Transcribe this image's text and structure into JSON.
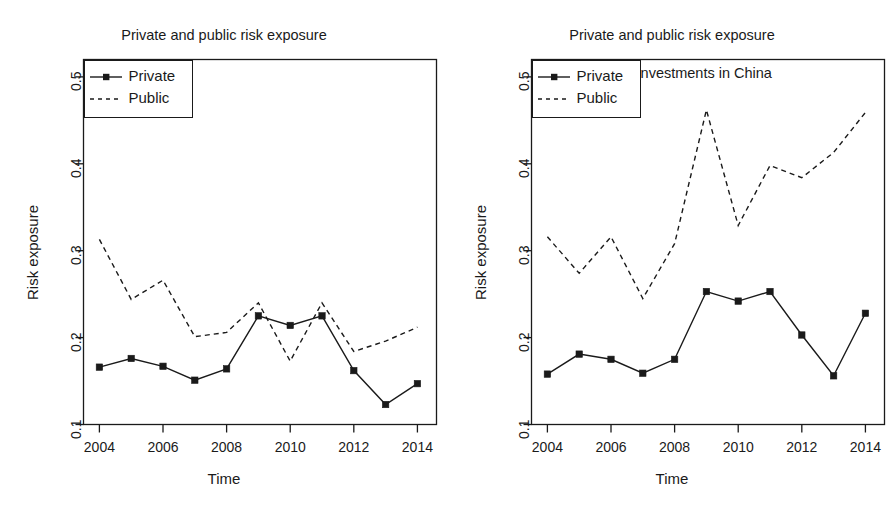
{
  "figure": {
    "width": 896,
    "height": 514,
    "background": "#ffffff",
    "ink_color": "#1a1a1a"
  },
  "panels": [
    {
      "id": "left",
      "title": "Private and public risk exposure",
      "title_lines": [
        "Private and public risk exposure"
      ],
      "xlabel": "Time",
      "ylabel": "Risk exposure",
      "legend": {
        "position": "top-left",
        "entries": [
          {
            "label": "Private",
            "style": "solid-with-square-marker"
          },
          {
            "label": "Public",
            "style": "dashed"
          }
        ]
      }
    },
    {
      "id": "right",
      "title": "Private and public risk exposure excluding investments in China",
      "title_lines": [
        "Private and public risk exposure",
        "excluding investments in China"
      ],
      "xlabel": "Time",
      "ylabel": "Risk exposure",
      "legend": {
        "position": "top-left",
        "entries": [
          {
            "label": "Private",
            "style": "solid-with-square-marker"
          },
          {
            "label": "Public",
            "style": "dashed"
          }
        ]
      }
    }
  ],
  "chart_data": [
    {
      "type": "line",
      "title": "Private and public risk exposure",
      "xlabel": "Time",
      "ylabel": "Risk exposure",
      "x": [
        2004,
        2005,
        2006,
        2007,
        2008,
        2009,
        2010,
        2011,
        2012,
        2013,
        2014
      ],
      "xticks": [
        2004,
        2006,
        2008,
        2010,
        2012,
        2014
      ],
      "xticklabels": [
        "2004",
        "2006",
        "2008",
        "2010",
        "2012",
        "2014"
      ],
      "yticks": [
        0.1,
        0.2,
        0.3,
        0.4,
        0.5
      ],
      "yticklabels": [
        "0.1",
        "0.2",
        "0.3",
        "0.4",
        "0.5"
      ],
      "xlim": [
        2003.5,
        2014.6
      ],
      "ylim": [
        0.1,
        0.52
      ],
      "grid": false,
      "legend_position": "top-left",
      "series": [
        {
          "name": "Private",
          "linestyle": "solid",
          "marker": "square",
          "values": [
            0.166,
            0.176,
            0.167,
            0.151,
            0.164,
            0.225,
            0.214,
            0.225,
            0.162,
            0.123,
            0.147
          ]
        },
        {
          "name": "Public",
          "linestyle": "dashed",
          "marker": "none",
          "values": [
            0.313,
            0.244,
            0.266,
            0.201,
            0.206,
            0.24,
            0.173,
            0.24,
            0.184,
            0.196,
            0.212
          ]
        }
      ]
    },
    {
      "type": "line",
      "title": "Private and public risk exposure excluding investments in China",
      "xlabel": "Time",
      "ylabel": "Risk exposure",
      "x": [
        2004,
        2005,
        2006,
        2007,
        2008,
        2009,
        2010,
        2011,
        2012,
        2013,
        2014
      ],
      "xticks": [
        2004,
        2006,
        2008,
        2010,
        2012,
        2014
      ],
      "xticklabels": [
        "2004",
        "2006",
        "2008",
        "2010",
        "2012",
        "2014"
      ],
      "yticks": [
        0.1,
        0.2,
        0.3,
        0.4,
        0.5
      ],
      "yticklabels": [
        "0.1",
        "0.2",
        "0.3",
        "0.4",
        "0.5"
      ],
      "xlim": [
        2003.5,
        2014.6
      ],
      "ylim": [
        0.1,
        0.52
      ],
      "grid": false,
      "legend_position": "top-left",
      "series": [
        {
          "name": "Private",
          "linestyle": "solid",
          "marker": "square",
          "values": [
            0.158,
            0.181,
            0.175,
            0.159,
            0.175,
            0.253,
            0.242,
            0.253,
            0.203,
            0.156,
            0.228
          ]
        },
        {
          "name": "Public",
          "linestyle": "dashed",
          "marker": "none",
          "values": [
            0.316,
            0.274,
            0.316,
            0.245,
            0.308,
            0.462,
            0.329,
            0.398,
            0.384,
            0.413,
            0.459
          ]
        }
      ]
    }
  ]
}
